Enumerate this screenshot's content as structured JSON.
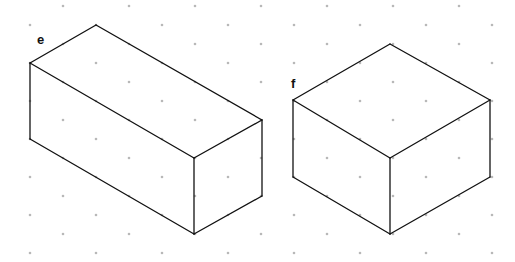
{
  "figure": {
    "grid": {
      "type": "isometric-dot",
      "dot_color": "#b8b8b8",
      "dx": 33,
      "dy": 19,
      "x0": 63,
      "y0": 6
    },
    "line_color": "#111111",
    "shapes": [
      {
        "label": "e",
        "label_pos": [
          37,
          33
        ],
        "description": "cuboid",
        "edges": [
          [
            [
              30,
              63
            ],
            [
              96,
              25
            ]
          ],
          [
            [
              96,
              25
            ],
            [
              262,
              120
            ]
          ],
          [
            [
              262,
              120
            ],
            [
              194,
              158
            ]
          ],
          [
            [
              194,
              158
            ],
            [
              30,
              63
            ]
          ],
          [
            [
              30,
              63
            ],
            [
              30,
              139
            ]
          ],
          [
            [
              194,
              158
            ],
            [
              194,
              234
            ]
          ],
          [
            [
              262,
              120
            ],
            [
              262,
              196
            ]
          ],
          [
            [
              30,
              139
            ],
            [
              194,
              234
            ]
          ],
          [
            [
              194,
              234
            ],
            [
              262,
              196
            ]
          ]
        ]
      },
      {
        "label": "f",
        "label_pos": [
          291,
          77
        ],
        "description": "cuboid",
        "edges": [
          [
            [
              293,
              100
            ],
            [
              390,
              44
            ]
          ],
          [
            [
              390,
              44
            ],
            [
              490,
              100
            ]
          ],
          [
            [
              490,
              100
            ],
            [
              390,
              158
            ]
          ],
          [
            [
              390,
              158
            ],
            [
              293,
              100
            ]
          ],
          [
            [
              293,
              100
            ],
            [
              293,
              177
            ]
          ],
          [
            [
              390,
              158
            ],
            [
              390,
              234
            ]
          ],
          [
            [
              490,
              100
            ],
            [
              490,
              177
            ]
          ],
          [
            [
              293,
              177
            ],
            [
              390,
              234
            ]
          ],
          [
            [
              390,
              234
            ],
            [
              490,
              177
            ]
          ]
        ]
      }
    ]
  }
}
